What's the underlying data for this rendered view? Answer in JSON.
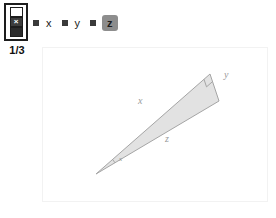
{
  "toolbar": {
    "step_selector": {
      "icon": "stacked-squares-selector-icon",
      "cells": [
        {
          "name": "step-cell-1",
          "state": "outline"
        },
        {
          "name": "step-cell-2",
          "state": "active",
          "glyph": "×"
        },
        {
          "name": "step-cell-3",
          "state": "filled"
        }
      ]
    },
    "step_counter": "1/3",
    "variables": [
      {
        "label": "x",
        "selected": false,
        "marker": "square-marker"
      },
      {
        "label": "y",
        "selected": false,
        "marker": "square-marker"
      },
      {
        "label": "z",
        "selected": true,
        "marker": "square-marker"
      }
    ]
  },
  "figure": {
    "type": "right-triangle",
    "fill": "#e2e2e2",
    "stroke": "#a5a5a5",
    "vertices": {
      "apex": {
        "x": 53,
        "y": 126
      },
      "top": {
        "x": 167,
        "y": 26
      },
      "right": {
        "x": 176,
        "y": 53
      }
    },
    "side_labels": [
      {
        "name": "side-x",
        "text": "x",
        "x": 95,
        "y": 56
      },
      {
        "name": "side-y",
        "text": "y",
        "x": 181,
        "y": 30
      },
      {
        "name": "side-z",
        "text": "z",
        "x": 122,
        "y": 94
      }
    ],
    "angle_labels": [
      {
        "name": "angle-x",
        "text": "x",
        "x": 76,
        "y": 113
      }
    ],
    "right_angle_marker": "right-angle-square",
    "angle_arc_marker": "angle-arc"
  }
}
